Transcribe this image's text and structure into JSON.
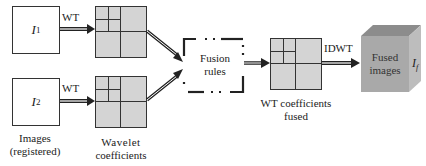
{
  "inputs": [
    {
      "symbol": "I",
      "subscript": "1",
      "transform_label": "WT"
    },
    {
      "symbol": "I",
      "subscript": "2",
      "transform_label": "WT"
    }
  ],
  "labels": {
    "images_line1": "Images",
    "images_line2": "(registered)",
    "wavelet_line1": "Wavelet",
    "wavelet_line2": "coefficients",
    "fusion_line1": "Fusion",
    "fusion_line2": "rules",
    "fused_coeff_line1": "WT coefficients",
    "fused_coeff_line2": "fused",
    "inverse_transform": "IDWT",
    "output_line1": "Fused",
    "output_line2": "images",
    "output_symbol": "I",
    "output_subscript": "f"
  },
  "colors": {
    "coefficient_fill": "#d4d4d4",
    "cube_front": "#a9a9a9",
    "cube_top": "#8c8c8c",
    "cube_side": "#bdbdbd",
    "stroke": "#333333"
  }
}
